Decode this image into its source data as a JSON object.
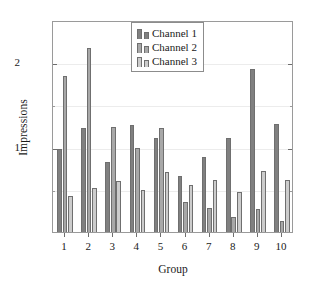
{
  "chart_data": {
    "type": "bar",
    "title": "",
    "subtitle": "",
    "xlabel": "Group",
    "ylabel": "Impressions",
    "categories": [
      "1",
      "2",
      "3",
      "4",
      "5",
      "6",
      "7",
      "8",
      "9",
      "10"
    ],
    "series": [
      {
        "name": "Channel 1",
        "color": "#808080",
        "values": [
          0.97,
          1.22,
          0.82,
          1.26,
          1.1,
          0.66,
          0.88,
          1.1,
          1.92,
          1.27
        ]
      },
      {
        "name": "Channel 2",
        "color": "#a8a8a8",
        "values": [
          1.83,
          2.16,
          1.23,
          0.99,
          1.22,
          0.35,
          0.28,
          0.18,
          0.27,
          0.13
        ]
      },
      {
        "name": "Channel 3",
        "color": "#cccccc",
        "values": [
          0.42,
          0.52,
          0.6,
          0.49,
          0.7,
          0.55,
          0.61,
          0.47,
          0.72,
          0.61
        ]
      }
    ],
    "ylim": [
      0,
      2.49
    ],
    "yticks": [
      1,
      2
    ],
    "ytick_labels": [
      "1",
      "2"
    ],
    "yticks_minor": [
      0.5,
      1.5,
      2.0
    ],
    "xlim": [
      0.5,
      10.5
    ],
    "grid": false,
    "legend": {
      "position": "top-center",
      "entries": [
        "Channel 1",
        "Channel 2",
        "Channel 3"
      ]
    },
    "bar_outline_color": "#6f6f6f",
    "frame_color": "#9a9a9a"
  },
  "axes": {
    "x_title": "Group",
    "y_title": "Impressions"
  }
}
